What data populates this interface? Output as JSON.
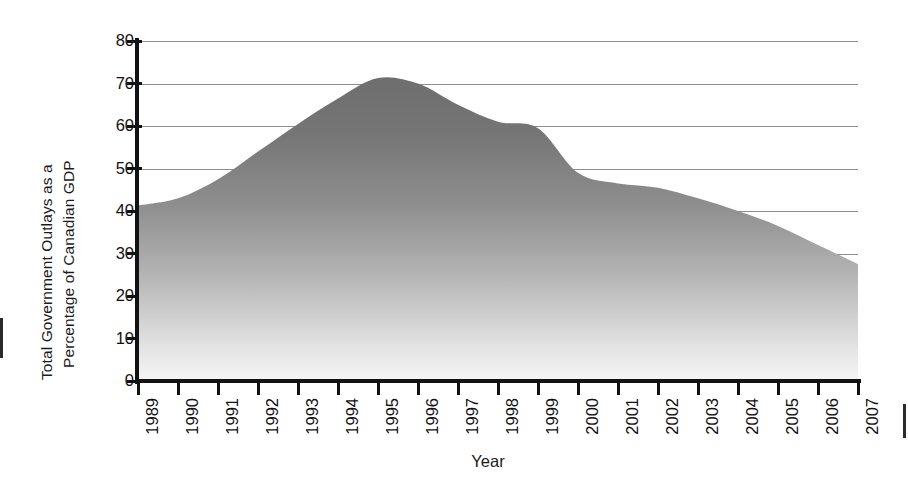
{
  "chart_data": {
    "type": "area",
    "title": "",
    "xlabel": "Year",
    "ylabel": "Total Government Outlays as a Percentage of Canadian GDP",
    "ylabel_line1": "Total Government Outlays as a",
    "ylabel_line2": "Percentage of Canadian GDP",
    "grid": true,
    "legend": "none",
    "xlim": [
      1989,
      2007
    ],
    "ylim": [
      0,
      80
    ],
    "ytick_labels": [
      "80",
      "70",
      "60",
      "50",
      "40",
      "30",
      "20",
      "10",
      "0"
    ],
    "ytick_values": [
      80,
      70,
      60,
      50,
      40,
      30,
      20,
      10,
      0
    ],
    "categories": [
      "1989",
      "1990",
      "1991",
      "1992",
      "1993",
      "1994",
      "1995",
      "1996",
      "1997",
      "1998",
      "1999",
      "2000",
      "2001",
      "2002",
      "2003",
      "2004",
      "2005",
      "2006",
      "2007"
    ],
    "values": [
      41.3,
      43.0,
      47.5,
      54.0,
      60.5,
      66.5,
      71.3,
      70.0,
      65.0,
      61.0,
      59.5,
      49.0,
      46.5,
      45.5,
      43.0,
      40.0,
      36.5,
      32.0,
      27.5
    ],
    "series": [
      {
        "name": "Total Government Outlays as a Percentage of Canadian GDP",
        "values": [
          41.3,
          43.0,
          47.5,
          54.0,
          60.5,
          66.5,
          71.3,
          70.0,
          65.0,
          61.0,
          59.5,
          49.0,
          46.5,
          45.5,
          43.0,
          40.0,
          36.5,
          32.0,
          27.5
        ]
      }
    ],
    "fill_top_color": "#6b6b6b",
    "fill_bottom_color": "#f2f2f2",
    "axis_color": "#121212",
    "grid_color": "#8d8d8d"
  }
}
